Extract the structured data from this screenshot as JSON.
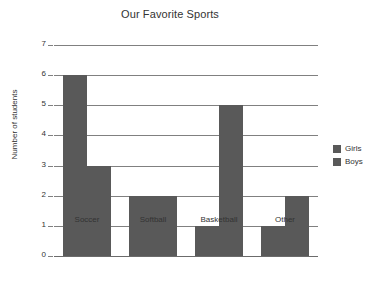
{
  "chart_data": {
    "type": "bar",
    "title": "Our Favorite Sports",
    "xlabel": "",
    "ylabel": "Number of students",
    "categories": [
      "Soccer",
      "Softball",
      "Basketball",
      "Other"
    ],
    "series": [
      {
        "name": "Girls",
        "values": [
          6,
          2,
          1,
          1
        ],
        "color": "#595959"
      },
      {
        "name": "Boys",
        "values": [
          3,
          2,
          5,
          2
        ],
        "color": "#595959"
      }
    ],
    "ylim": [
      0,
      7
    ],
    "ytick_labels": [
      "0",
      "1",
      "2",
      "3",
      "4",
      "5",
      "6",
      "7"
    ],
    "ytick_values": [
      0,
      1,
      2,
      3,
      4,
      5,
      6,
      7
    ],
    "grid": true,
    "legend_position": "right",
    "background_color": "#ffffff",
    "gridline_color": "#808080",
    "text_color": "#333333"
  },
  "legend": {
    "entries": [
      {
        "label": "Girls"
      },
      {
        "label": "Boys"
      }
    ]
  }
}
